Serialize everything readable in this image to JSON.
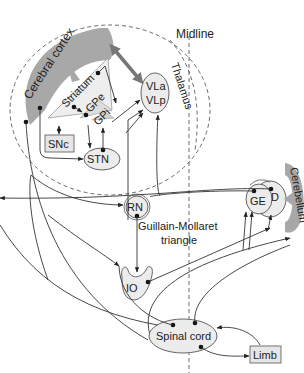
{
  "diagram": {
    "labels": {
      "midline": "Midline",
      "cerebral_cortex": "Cerebral cortex",
      "thalamus": "Thalamus",
      "striatum": "Striatum",
      "gpe": "GPe",
      "gpi": "GPi",
      "vla": "VLa",
      "vlp": "VLp",
      "snc": "SNc",
      "stn": "STN",
      "rn": "RN",
      "ge": "GE",
      "d": "D",
      "cerebellum": "Cerebellum",
      "guillain_line1": "Guillain-Mollaret",
      "guillain_line2": "triangle",
      "io": "IO",
      "spinal_cord": "Spinal cord",
      "limb": "Limb"
    },
    "colors": {
      "structure_fill": "#ececec",
      "cortex_gray": "#a8a8a8",
      "line": "#333333"
    }
  }
}
